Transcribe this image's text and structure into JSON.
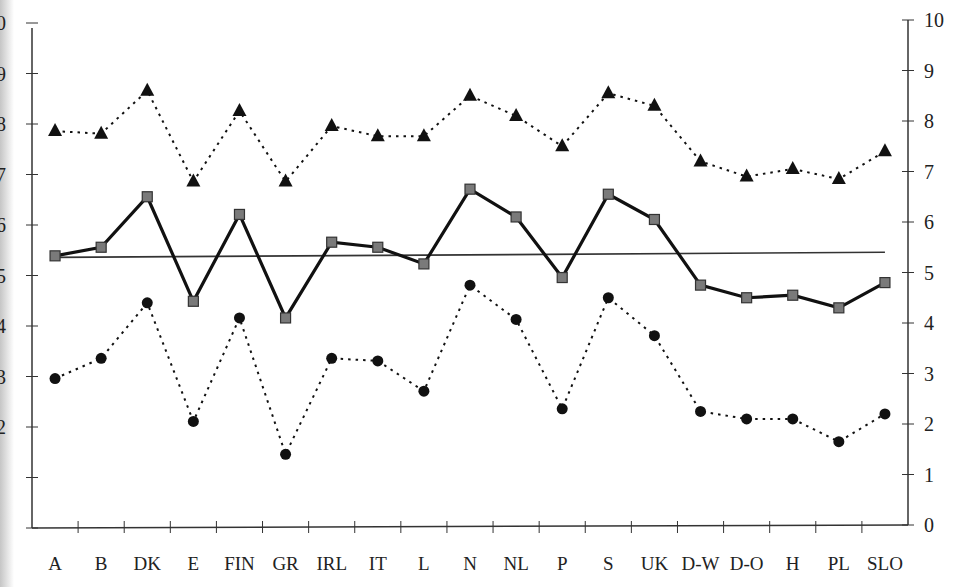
{
  "chart_data": {
    "type": "line",
    "title": "",
    "xlabel": "",
    "ylabel": "",
    "ylim": [
      0,
      10
    ],
    "y_ticks": [
      0,
      1,
      2,
      3,
      4,
      5,
      6,
      7,
      8,
      9,
      10
    ],
    "left_axis_visible_labels": [
      "0",
      "9",
      "8",
      "7",
      "6",
      "5",
      "4",
      "3",
      "2"
    ],
    "right_axis_labels": [
      "0",
      "1",
      "2",
      "3",
      "4",
      "5",
      "6",
      "7",
      "8",
      "9",
      "10"
    ],
    "grid": false,
    "legend": null,
    "categories": [
      "A",
      "B",
      "DK",
      "E",
      "FIN",
      "GR",
      "IRL",
      "IT",
      "L",
      "N",
      "NL",
      "P",
      "S",
      "UK",
      "D-W",
      "D-O",
      "H",
      "PL",
      "SLO"
    ],
    "series": [
      {
        "name": "upper (triangles, dotted)",
        "marker": "triangle",
        "line": "dotted",
        "color": "#111111",
        "values": [
          7.8,
          7.75,
          8.6,
          6.8,
          8.2,
          6.8,
          7.9,
          7.7,
          7.7,
          8.5,
          8.1,
          7.5,
          8.55,
          8.3,
          7.2,
          6.9,
          7.05,
          6.85,
          7.4
        ]
      },
      {
        "name": "mean (squares, solid)",
        "marker": "square",
        "line": "solid",
        "color": "#111111",
        "marker_fill": "#7a7a7a",
        "values": [
          5.33,
          5.5,
          6.5,
          4.43,
          6.15,
          4.1,
          5.6,
          5.5,
          5.17,
          6.65,
          6.1,
          4.9,
          6.55,
          6.05,
          4.75,
          4.5,
          4.55,
          4.3,
          4.8
        ]
      },
      {
        "name": "lower (circles, dotted)",
        "marker": "circle",
        "line": "dotted",
        "color": "#111111",
        "values": [
          2.9,
          3.3,
          4.4,
          2.05,
          4.1,
          1.4,
          3.3,
          3.25,
          2.65,
          4.75,
          4.07,
          2.3,
          4.5,
          3.75,
          2.25,
          2.1,
          2.1,
          1.65,
          2.2
        ]
      }
    ],
    "reference_line": {
      "name": "overall mean",
      "start": 5.3,
      "end": 5.4,
      "line": "solid thin"
    }
  }
}
